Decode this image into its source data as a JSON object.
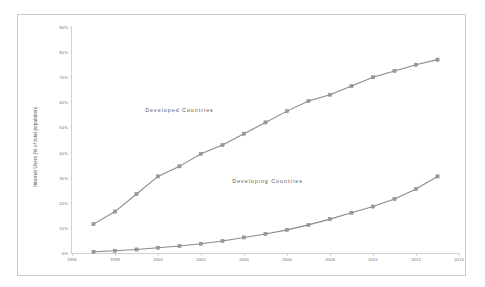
{
  "chart_data": {
    "type": "line",
    "title": "",
    "xlabel": "",
    "ylabel": "Internet Users (% of total population)",
    "xlim": [
      1996,
      2014
    ],
    "ylim": [
      0,
      90
    ],
    "grid": false,
    "legend_position": "inline-annotations",
    "x_tick_labels": [
      "1996",
      "1998",
      "2000",
      "2002",
      "2004",
      "2006",
      "2008",
      "2010",
      "2012",
      "2014"
    ],
    "x_tick_values": [
      1996,
      1998,
      2000,
      2002,
      2004,
      2006,
      2008,
      2010,
      2012,
      2014
    ],
    "y_tick_labels": [
      "0%",
      "10%",
      "20%",
      "30%",
      "40%",
      "50%",
      "60%",
      "70%",
      "80%",
      "90%"
    ],
    "y_tick_values": [
      0,
      10,
      20,
      30,
      40,
      50,
      60,
      70,
      80,
      90
    ],
    "x": [
      1997,
      1998,
      1999,
      2000,
      2001,
      2002,
      2003,
      2004,
      2005,
      2006,
      2007,
      2008,
      2009,
      2010,
      2011,
      2012,
      2013
    ],
    "series": [
      {
        "name": "Developed Countries",
        "color": "#8a8a8a",
        "values": [
          11.5,
          16.5,
          23.5,
          30.5,
          34.5,
          39.5,
          43.0,
          47.5,
          52.0,
          56.5,
          60.5,
          63.0,
          66.5,
          70.0,
          72.5,
          75.0,
          77.0
        ],
        "annotation": "Developed Countries",
        "annotation_x": 2001.0,
        "annotation_y": 57.0
      },
      {
        "name": "Developing Countries",
        "color": "#8a8a8a",
        "values": [
          0.5,
          0.9,
          1.4,
          2.1,
          2.8,
          3.7,
          4.8,
          6.2,
          7.6,
          9.2,
          11.2,
          13.5,
          16.0,
          18.5,
          21.5,
          25.5,
          30.5
        ],
        "annotation": "Developing Countries",
        "annotation_x": 2005.1,
        "annotation_y": 28.5
      }
    ]
  }
}
